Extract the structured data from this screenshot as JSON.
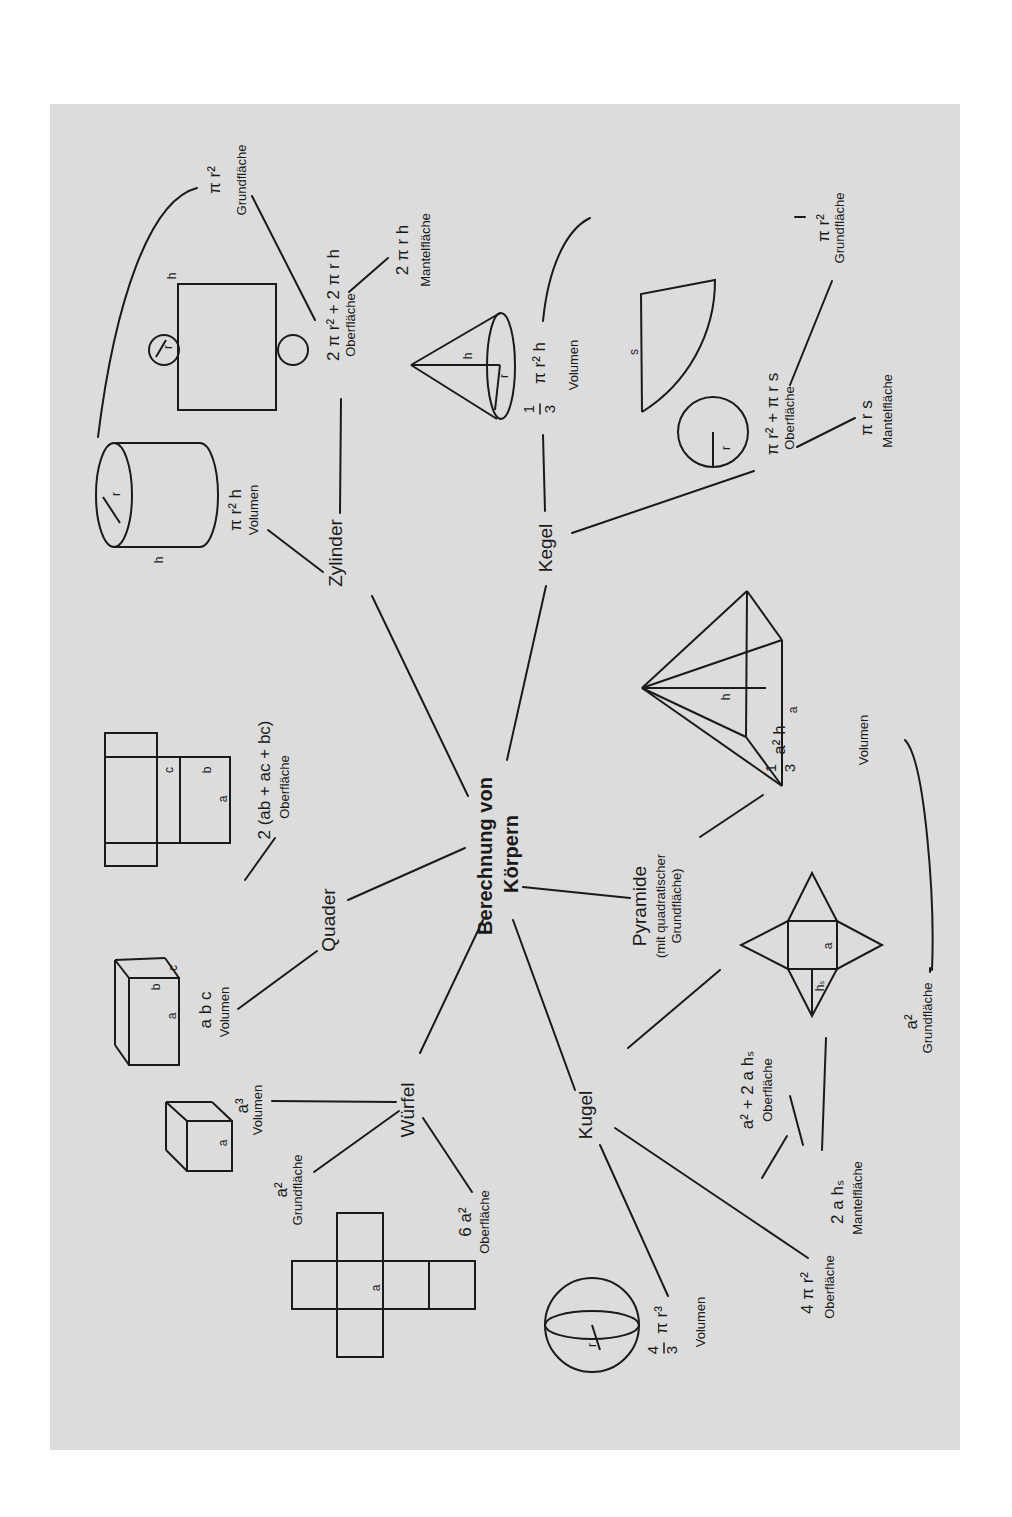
{
  "title": {
    "line1": "Berechnung von",
    "line2": "Körpern"
  },
  "nodes": {
    "zylinder": {
      "label": "Zylinder",
      "volume": {
        "formula": "π r² h",
        "caption": "Volumen"
      },
      "surface": {
        "formula": "2 π r² + 2 π r h",
        "caption": "Oberfläche"
      },
      "lateral": {
        "formula": "2 π r h",
        "caption": "Mantelfläche"
      },
      "base": {
        "formula": "π r²",
        "caption": "Grundfläche"
      },
      "figure_labels": {
        "radius": "r",
        "height": "h"
      }
    },
    "quader": {
      "label": "Quader",
      "volume": {
        "formula": "a b c",
        "caption": "Volumen"
      },
      "surface": {
        "formula": "2 (ab + ac + bc)",
        "caption": "Oberfläche"
      },
      "figure_labels": {
        "a": "a",
        "b": "b",
        "c": "c"
      }
    },
    "wuerfel": {
      "label": "Würfel",
      "volume": {
        "formula": "a³",
        "caption": "Volumen"
      },
      "base": {
        "formula": "a²",
        "caption": "Grundfläche"
      },
      "surface": {
        "formula": "6 a²",
        "caption": "Oberfläche"
      },
      "figure_labels": {
        "a": "a"
      }
    },
    "kugel": {
      "label": "Kugel",
      "volume": {
        "numerator": "4",
        "denominator": "3",
        "formula": "π r³",
        "caption": "Volumen"
      },
      "surface": {
        "formula": "4 π r²",
        "caption": "Oberfläche"
      },
      "figure_labels": {
        "radius": "r"
      }
    },
    "pyramide": {
      "label": "Pyramide",
      "sublabel1": "(mit quadratischer",
      "sublabel2": "Grundfläche)",
      "volume": {
        "numerator": "1",
        "denominator": "3",
        "formula": "a² h",
        "caption": "Volumen"
      },
      "surface": {
        "formula": "a² + 2 a hₛ",
        "caption": "Oberfläche"
      },
      "lateral": {
        "formula": "2 a hₛ",
        "caption": "Mantelfläche"
      },
      "base": {
        "formula": "a²",
        "caption": "Grundfläche"
      },
      "figure_labels": {
        "a": "a",
        "h": "h",
        "hs": "hₛ"
      }
    },
    "kegel": {
      "label": "Kegel",
      "volume": {
        "numerator": "1",
        "denominator": "3",
        "formula": "π r² h",
        "caption": "Volumen"
      },
      "surface": {
        "formula": "π r² + π r s",
        "caption": "Oberfläche"
      },
      "lateral": {
        "formula": "π r s",
        "caption": "Mantelfläche"
      },
      "base": {
        "formula": "π r²",
        "caption": "Grundfläche"
      },
      "figure_labels": {
        "radius": "r",
        "height": "h",
        "slant": "s"
      }
    }
  }
}
